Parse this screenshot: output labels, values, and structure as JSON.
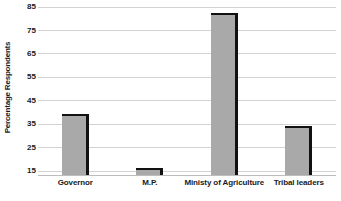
{
  "chart_data": {
    "type": "bar",
    "title": "",
    "xlabel": "",
    "ylabel": "Percentage Respondents",
    "categories": [
      "Governor",
      "M.P.",
      "Ministy of Agriculture",
      "Tribal leaders"
    ],
    "values": [
      39,
      16,
      82,
      34
    ],
    "ylim": [
      13,
      88
    ],
    "yticks": [
      15,
      25,
      35,
      45,
      55,
      65,
      75,
      85
    ],
    "ytick_labels": [
      "15",
      "25",
      "35",
      "45",
      "55",
      "65",
      "75",
      "85"
    ],
    "grid": true,
    "legend": false,
    "series": [
      {
        "name": "Percentage Respondents",
        "values": [
          39,
          16,
          82,
          34
        ]
      }
    ],
    "colors": {
      "bar_fill": "#a9a9a9",
      "bar_edge": "#111111",
      "gridline": "#d2d2d2",
      "background": "#ffffff",
      "text": "#1a1a1a"
    }
  }
}
